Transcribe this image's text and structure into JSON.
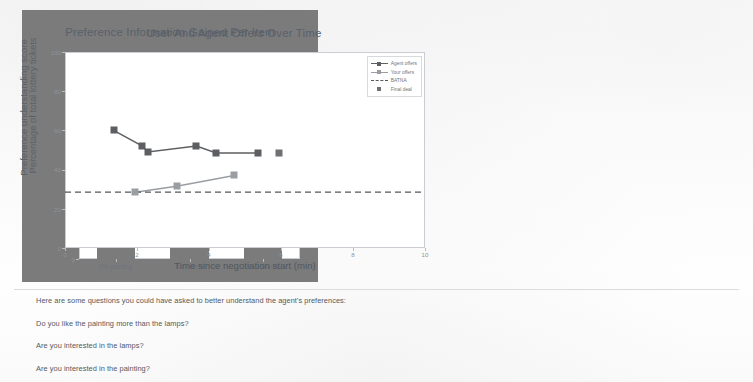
{
  "bar_chart": {
    "title": "Preference Information Gained Per Item",
    "ylabel": "Preference understanding score",
    "yticks": [
      "0",
      "1",
      "2",
      "3"
    ],
    "categories": [
      "the painting",
      "the lamps",
      "the records"
    ],
    "values": [
      1,
      1,
      3
    ],
    "bar_color": "#7b7b7b"
  },
  "line_chart": {
    "title": "User And Agent Offers Over Time",
    "ylabel": "Percentage of total lottery tickets",
    "xlabel": "Time since negotiation start (min)",
    "yticks": [
      "0",
      "20",
      "40",
      "60",
      "80",
      "100"
    ],
    "xticks": [
      "0",
      "2",
      "4",
      "6",
      "8",
      "10"
    ],
    "legend": [
      {
        "label": "Agent offers",
        "color": "#5d5f62",
        "style": "line-marker"
      },
      {
        "label": "Your offers",
        "color": "#9a9da1",
        "style": "line-marker"
      },
      {
        "label": "BATNA",
        "color": "#555759",
        "style": "dashed"
      },
      {
        "label": "Final deal",
        "color": "#6e7073",
        "style": "marker"
      }
    ]
  },
  "chart_data": [
    {
      "type": "bar",
      "title": "Preference Information Gained Per Item",
      "xlabel": "",
      "ylabel": "Preference understanding score",
      "categories": [
        "the painting",
        "the lamps",
        "the records"
      ],
      "values": [
        1,
        1,
        3
      ],
      "ylim": [
        0,
        3
      ],
      "yticks": [
        0,
        1,
        2,
        3
      ],
      "grid": false,
      "legend": "none",
      "bar_color": "#7b7b7b"
    },
    {
      "type": "line",
      "title": "User And Agent Offers Over Time",
      "xlabel": "Time since negotiation start (min)",
      "ylabel": "Percentage of total lottery tickets",
      "xlim": [
        0,
        10
      ],
      "ylim": [
        0,
        100
      ],
      "xticks": [
        0,
        2,
        4,
        6,
        8,
        10
      ],
      "yticks": [
        0,
        20,
        40,
        60,
        80,
        100
      ],
      "grid": false,
      "legend_position": "upper right",
      "series": [
        {
          "name": "Agent offers",
          "color": "#5d5f62",
          "marker": "square",
          "x": [
            1.35,
            2.15,
            2.3,
            3.65,
            4.2,
            5.35
          ],
          "y": [
            60.0,
            52.0,
            49.0,
            52.0,
            48.5,
            48.5
          ]
        },
        {
          "name": "Your offers",
          "color": "#9a9da1",
          "marker": "square",
          "x": [
            1.95,
            3.1,
            4.7
          ],
          "y": [
            28.5,
            31.5,
            37.0
          ]
        },
        {
          "name": "BATNA",
          "color": "#555759",
          "style": "dashed",
          "value": 28.5
        },
        {
          "name": "Final deal",
          "color": "#6e7073",
          "marker": "square",
          "x": [
            5.95
          ],
          "y": [
            48.5
          ]
        }
      ]
    }
  ],
  "questions": {
    "intro": "Here are some questions you could have asked to better understand the agent's preferences:",
    "items": [
      "Do you like the painting more than the lamps?",
      "Are you interested in the lamps?",
      "Are you interested in the painting?"
    ]
  }
}
